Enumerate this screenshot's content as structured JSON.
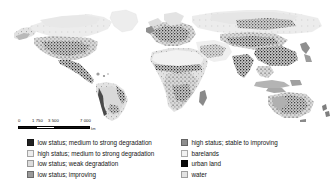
{
  "figure": {
    "background_color": "#ffffff"
  },
  "map": {
    "name": "world-degradation-map",
    "projection": "equirectangular",
    "ocean_color": "#ffffff",
    "land_base_color": "#d4d4d4",
    "degradation_color": "#4a4a4a",
    "strong_degradation_color": "#1e1e1e",
    "water_color": "#e8e8e8",
    "bareland_color": "#f2f2f2"
  },
  "scalebar": {
    "name": "map-scale-bar",
    "unit": "km",
    "ticks": [
      {
        "label": "0",
        "position_pct": 0
      },
      {
        "label": "1 750",
        "position_pct": 25
      },
      {
        "label": "3 500",
        "position_pct": 50
      },
      {
        "label": "7 000",
        "position_pct": 100
      }
    ],
    "segments": [
      {
        "fill": "dark",
        "width_pct": 25
      },
      {
        "fill": "light",
        "width_pct": 25
      },
      {
        "fill": "dark",
        "width_pct": 50
      }
    ]
  },
  "legend": {
    "name": "map-legend",
    "columns": [
      {
        "name": "legend-column-left",
        "items": [
          {
            "label": "low status; medium to strong degradation",
            "color": "#222222"
          },
          {
            "label": "high status; medium to strong degradation",
            "color": "#ededed"
          },
          {
            "label": "low status; weak degradation",
            "color": "#dcdcdc"
          },
          {
            "label": "low status; improving",
            "color": "#9a9a9a"
          }
        ]
      },
      {
        "name": "legend-column-right",
        "items": [
          {
            "label": "high status; stable to improving",
            "color": "#8e8e8e"
          },
          {
            "label": "barelands",
            "color": "#f2f2f2"
          },
          {
            "label": "urban land",
            "color": "#0a0a0a"
          },
          {
            "label": "water",
            "color": "#e3e3e3"
          }
        ]
      }
    ]
  }
}
